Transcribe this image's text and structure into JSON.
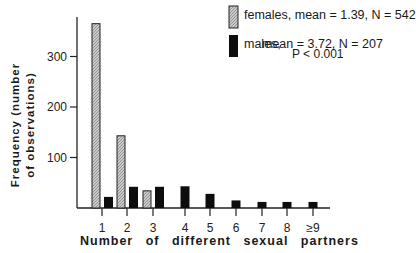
{
  "chart_data": {
    "type": "bar",
    "title": "",
    "xlabel": "Number of different sexual partners",
    "ylabel": [
      "Frequency (number",
      "of observations)"
    ],
    "categories": [
      "1",
      "2",
      "3",
      "4",
      "5",
      "6",
      "7",
      "8",
      "≥9"
    ],
    "series": [
      {
        "name": "females",
        "label": "females, mean = 1.39, N = 542",
        "pattern": "hatched-gray",
        "values": [
          365,
          143,
          34,
          0,
          0,
          0,
          0,
          0,
          0
        ]
      },
      {
        "name": "males",
        "label": "males,    mean = 3.72, N = 207",
        "pattern": "solid-black",
        "values": [
          22,
          42,
          42,
          43,
          28,
          15,
          12,
          12,
          12
        ]
      }
    ],
    "yticks": [
      100,
      200,
      300
    ],
    "ylim": [
      0,
      380
    ],
    "grid": false,
    "legend_position": "top-right",
    "annotations": [
      "P < 0.001"
    ],
    "colors": {
      "females": "#b8b8b8",
      "males": "#0d0d0d",
      "axis": "#222222"
    }
  },
  "legend": {
    "females": "females, mean = 1.39, N = 542",
    "males_name": "males,",
    "males_stats": "mean = 3.72, N = 207",
    "pvalue": "P < 0.001"
  },
  "axes": {
    "ylabel_line1": "Frequency  (number",
    "ylabel_line2": "of  observations)",
    "xlabel": "Number  of  different  sexual  partners"
  }
}
